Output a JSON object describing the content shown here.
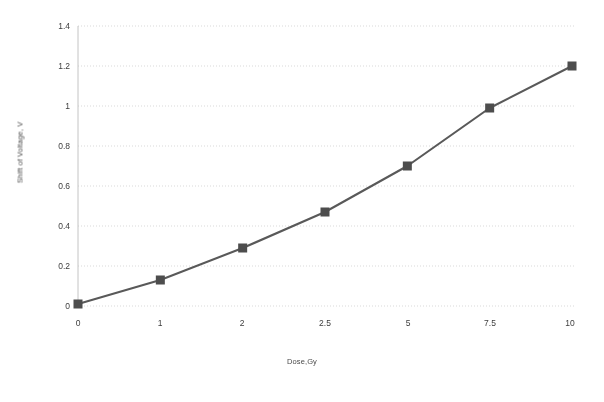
{
  "chart_data": {
    "type": "line",
    "title": "",
    "xlabel": "Dose,Gy",
    "ylabel": "Shift of Voltage, V",
    "categories": [
      "0",
      "1",
      "2",
      "2.5",
      "5",
      "7.5",
      "10"
    ],
    "x_numeric": [
      0,
      1,
      2,
      2.5,
      5,
      7.5,
      10
    ],
    "values": [
      0.01,
      0.13,
      0.29,
      0.47,
      0.7,
      0.99,
      1.2
    ],
    "series": [
      {
        "name": "Shift of Voltage",
        "values": [
          0.01,
          0.13,
          0.29,
          0.47,
          0.7,
          0.99,
          1.2
        ]
      }
    ],
    "ylim": [
      0,
      1.4
    ],
    "yticks": [
      "0",
      "0.2",
      "0.4",
      "0.6",
      "0.8",
      "1",
      "1.2",
      "1.4"
    ],
    "ytick_values": [
      0,
      0.2,
      0.4,
      0.6,
      0.8,
      1,
      1.2,
      1.4
    ],
    "xticks": [
      "0",
      "1",
      "2",
      "2.5",
      "5",
      "7.5",
      "10"
    ],
    "grid": "horizontal-dotted",
    "legend": "none",
    "marker": "square",
    "colors": {
      "line": "#595959",
      "marker": "#4d4d4d",
      "gridline": "#d9d9d9",
      "axis": "#bfbfbf",
      "text": "#3d3d3d"
    }
  }
}
